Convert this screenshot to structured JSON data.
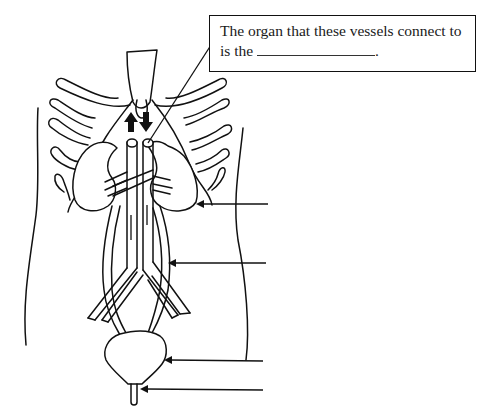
{
  "diagram": {
    "callout": {
      "text_before_blank": "The organ that these vessels connect to is the",
      "blank": "",
      "text_after_blank": "."
    },
    "structures": [
      {
        "id": "kidney",
        "label": ""
      },
      {
        "id": "ureter",
        "label": ""
      },
      {
        "id": "bladder",
        "label": ""
      },
      {
        "id": "urethra",
        "label": ""
      },
      {
        "id": "aorta-vena-cava",
        "label": ""
      }
    ],
    "label_arrows": [
      {
        "target": "kidney",
        "y": 204
      },
      {
        "target": "ureter",
        "y": 263
      },
      {
        "target": "bladder",
        "y": 360
      },
      {
        "target": "urethra",
        "y": 389
      }
    ],
    "flow_arrows": [
      {
        "direction": "up"
      },
      {
        "direction": "down"
      }
    ],
    "colors": {
      "line": "#111111",
      "background": "#ffffff"
    }
  }
}
